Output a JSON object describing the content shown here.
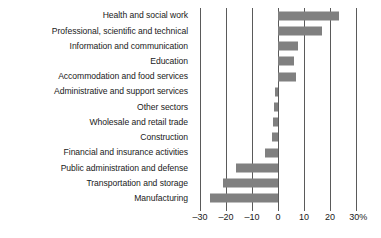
{
  "chart_data": {
    "type": "bar",
    "orientation": "horizontal",
    "title": "",
    "subtitle": "",
    "xlabel": "",
    "ylabel": "",
    "xlim": [
      -30,
      30
    ],
    "grid": true,
    "legend": "none",
    "axis_unit": "%",
    "tick_labels": [
      "–30",
      "–20",
      "–10",
      "0",
      "10",
      "20",
      "30%"
    ],
    "tick_values": [
      -30,
      -20,
      -10,
      0,
      10,
      20,
      30
    ],
    "bar_color": "#808080",
    "gridline_color": "#5a5a5a",
    "categories": [
      "Health and social work",
      "Professional, scientific and technical",
      "Information and communication",
      "Education",
      "Accommodation and food services",
      "Administrative and support services",
      "Other sectors",
      "Wholesale and retail trade",
      "Construction",
      "Financial and insurance activities",
      "Public administration and defense",
      "Transportation and storage",
      "Manufacturing"
    ],
    "values": [
      23.5,
      17,
      7.5,
      6,
      7,
      -1,
      -1.5,
      -2,
      -2.5,
      -5,
      -16,
      -21,
      -26
    ]
  }
}
